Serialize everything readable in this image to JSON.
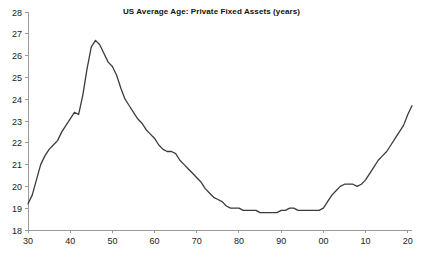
{
  "chart_data": {
    "type": "line",
    "title": "US Average Age: Private Fixed Assets (years)",
    "xlabel": "",
    "ylabel": "",
    "xlim": [
      1930,
      2021
    ],
    "ylim": [
      18,
      28
    ],
    "ytick_values": [
      18,
      19,
      20,
      21,
      22,
      23,
      24,
      25,
      26,
      27,
      28
    ],
    "ytick_labels": [
      "18",
      "19",
      "20",
      "21",
      "22",
      "23",
      "24",
      "25",
      "26",
      "27",
      "28"
    ],
    "xtick_values": [
      1930,
      1940,
      1950,
      1960,
      1970,
      1980,
      1990,
      2000,
      2010,
      2020
    ],
    "xtick_labels": [
      "30",
      "40",
      "50",
      "60",
      "70",
      "80",
      "90",
      "00",
      "10",
      "20"
    ],
    "grid": false,
    "legend": "none",
    "line_color": "#3b3b3b",
    "series": [
      {
        "name": "US Average Age: Private Fixed Assets",
        "x": [
          1930,
          1931,
          1932,
          1933,
          1934,
          1935,
          1936,
          1937,
          1938,
          1939,
          1940,
          1941,
          1942,
          1943,
          1944,
          1945,
          1946,
          1947,
          1948,
          1949,
          1950,
          1951,
          1952,
          1953,
          1954,
          1955,
          1956,
          1957,
          1958,
          1959,
          1960,
          1961,
          1962,
          1963,
          1964,
          1965,
          1966,
          1967,
          1968,
          1969,
          1970,
          1971,
          1972,
          1973,
          1974,
          1975,
          1976,
          1977,
          1978,
          1979,
          1980,
          1981,
          1982,
          1983,
          1984,
          1985,
          1986,
          1987,
          1988,
          1989,
          1990,
          1991,
          1992,
          1993,
          1994,
          1995,
          1996,
          1997,
          1998,
          1999,
          2000,
          2001,
          2002,
          2003,
          2004,
          2005,
          2006,
          2007,
          2008,
          2009,
          2010,
          2011,
          2012,
          2013,
          2014,
          2015,
          2016,
          2017,
          2018,
          2019,
          2020,
          2021
        ],
        "values": [
          19.2,
          19.6,
          20.3,
          21.0,
          21.4,
          21.7,
          21.9,
          22.1,
          22.5,
          22.8,
          23.1,
          23.4,
          23.3,
          24.2,
          25.4,
          26.4,
          26.7,
          26.5,
          26.1,
          25.7,
          25.5,
          25.1,
          24.5,
          24.0,
          23.7,
          23.4,
          23.1,
          22.9,
          22.6,
          22.4,
          22.2,
          21.9,
          21.7,
          21.6,
          21.6,
          21.5,
          21.2,
          21.0,
          20.8,
          20.6,
          20.4,
          20.2,
          19.9,
          19.7,
          19.5,
          19.4,
          19.3,
          19.1,
          19.0,
          19.0,
          19.0,
          18.9,
          18.9,
          18.9,
          18.9,
          18.8,
          18.8,
          18.8,
          18.8,
          18.8,
          18.9,
          18.9,
          19.0,
          19.0,
          18.9,
          18.9,
          18.9,
          18.9,
          18.9,
          18.9,
          19.0,
          19.3,
          19.6,
          19.8,
          20.0,
          20.1,
          20.1,
          20.1,
          20.0,
          20.1,
          20.3,
          20.6,
          20.9,
          21.2,
          21.4,
          21.6,
          21.9,
          22.2,
          22.5,
          22.8,
          23.3,
          23.7
        ]
      }
    ]
  }
}
